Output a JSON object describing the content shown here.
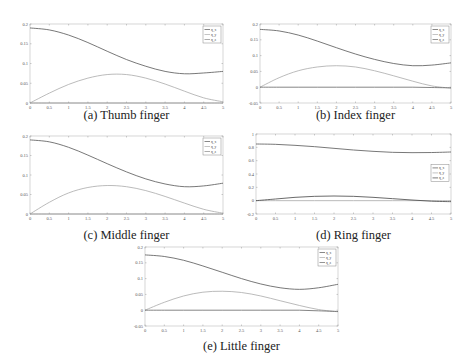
{
  "figure": {
    "panels": [
      {
        "id": "a",
        "caption": "(a) Thumb finger"
      },
      {
        "id": "b",
        "caption": "(b) Index finger"
      },
      {
        "id": "c",
        "caption": "(c) Middle finger"
      },
      {
        "id": "d",
        "caption": "(d) Ring finger"
      },
      {
        "id": "e",
        "caption": "(e) Little finger"
      }
    ]
  },
  "chart_data": [
    {
      "type": "line",
      "title": "(a) Thumb finger",
      "xlabel": "",
      "ylabel": "",
      "xlim": [
        0,
        5
      ],
      "ylim": [
        0,
        0.2
      ],
      "xticks": [
        "0",
        "0.5",
        "1",
        "1.5",
        "2",
        "2.5",
        "3",
        "3.5",
        "4",
        "4.5",
        "5"
      ],
      "yticks": [
        "0",
        "0.05",
        "0.1",
        "0.15",
        "0.2"
      ],
      "legend": [
        "q_x",
        "q_y",
        "q_z"
      ],
      "legend_position": "upper right",
      "grid": false,
      "x": [
        0,
        0.5,
        1,
        1.5,
        2,
        2.5,
        3,
        3.5,
        4,
        4.5,
        5
      ],
      "series": [
        {
          "name": "q_x",
          "color": "#555555",
          "values": [
            0.19,
            0.185,
            0.172,
            0.153,
            0.131,
            0.11,
            0.093,
            0.08,
            0.074,
            0.076,
            0.08
          ]
        },
        {
          "name": "q_y",
          "color": "#aaaaaa",
          "values": [
            0.0,
            0.025,
            0.047,
            0.063,
            0.072,
            0.072,
            0.063,
            0.048,
            0.03,
            0.013,
            0.003
          ]
        },
        {
          "name": "q_z",
          "color": "#888888",
          "values": [
            0,
            0,
            0,
            0,
            0,
            0,
            0,
            0,
            0,
            0,
            0
          ]
        }
      ]
    },
    {
      "type": "line",
      "title": "(b) Index finger",
      "xlabel": "",
      "ylabel": "",
      "xlim": [
        0,
        5
      ],
      "ylim": [
        -0.05,
        0.2
      ],
      "xticks": [
        "0",
        "0.5",
        "1",
        "1.5",
        "2",
        "2.5",
        "3",
        "3.5",
        "4",
        "4.5",
        "5"
      ],
      "yticks": [
        "-0.05",
        "0",
        "0.05",
        "0.1",
        "0.15",
        "0.2"
      ],
      "legend": [
        "q_x",
        "q_y",
        "q_z"
      ],
      "legend_position": "upper right",
      "grid": false,
      "x": [
        0,
        0.5,
        1,
        1.5,
        2,
        2.5,
        3,
        3.5,
        4,
        4.5,
        5
      ],
      "series": [
        {
          "name": "q_x",
          "color": "#555555",
          "values": [
            0.183,
            0.178,
            0.165,
            0.146,
            0.125,
            0.105,
            0.088,
            0.075,
            0.068,
            0.07,
            0.077
          ]
        },
        {
          "name": "q_y",
          "color": "#aaaaaa",
          "values": [
            0.0,
            0.03,
            0.052,
            0.064,
            0.068,
            0.064,
            0.052,
            0.036,
            0.019,
            0.004,
            -0.003
          ]
        },
        {
          "name": "q_z",
          "color": "#666666",
          "values": [
            0,
            0,
            0,
            0,
            0,
            0,
            0,
            0,
            0,
            -0.001,
            -0.002
          ]
        }
      ]
    },
    {
      "type": "line",
      "title": "(c) Middle finger",
      "xlabel": "",
      "ylabel": "",
      "xlim": [
        0,
        5
      ],
      "ylim": [
        0,
        0.2
      ],
      "xticks": [
        "0",
        "0.5",
        "1",
        "1.5",
        "2",
        "2.5",
        "3",
        "3.5",
        "4",
        "4.5",
        "5"
      ],
      "yticks": [
        "0",
        "0.05",
        "0.1",
        "0.15",
        "0.2"
      ],
      "legend": [
        "q_x",
        "q_y",
        "q_z"
      ],
      "legend_position": "upper right",
      "grid": false,
      "x": [
        0,
        0.5,
        1,
        1.5,
        2,
        2.5,
        3,
        3.5,
        4,
        4.5,
        5
      ],
      "series": [
        {
          "name": "q_x",
          "color": "#555555",
          "values": [
            0.19,
            0.185,
            0.171,
            0.151,
            0.129,
            0.108,
            0.09,
            0.077,
            0.07,
            0.072,
            0.079
          ]
        },
        {
          "name": "q_y",
          "color": "#aaaaaa",
          "values": [
            0.0,
            0.03,
            0.054,
            0.068,
            0.073,
            0.07,
            0.06,
            0.045,
            0.028,
            0.012,
            0.002
          ]
        },
        {
          "name": "q_z",
          "color": "#888888",
          "values": [
            0,
            0,
            0,
            0,
            0,
            0,
            0,
            0,
            0,
            0,
            0
          ]
        }
      ]
    },
    {
      "type": "line",
      "title": "(d) Ring finger",
      "xlabel": "",
      "ylabel": "",
      "xlim": [
        0,
        5
      ],
      "ylim": [
        -0.2,
        1
      ],
      "xticks": [
        "0",
        "0.5",
        "1",
        "1.5",
        "2",
        "2.5",
        "3",
        "3.5",
        "4",
        "4.5",
        "5"
      ],
      "yticks": [
        "-0.2",
        "0",
        "0.2",
        "0.4",
        "0.6",
        "0.8",
        "1"
      ],
      "legend": [
        "q_x",
        "q_y",
        "q_z"
      ],
      "legend_position": "center right",
      "grid": false,
      "x": [
        0,
        0.5,
        1,
        1.5,
        2,
        2.5,
        3,
        3.5,
        4,
        4.5,
        5
      ],
      "series": [
        {
          "name": "q_x",
          "color": "#555555",
          "values": [
            0.85,
            0.845,
            0.83,
            0.81,
            0.785,
            0.76,
            0.74,
            0.725,
            0.72,
            0.722,
            0.73
          ]
        },
        {
          "name": "q_y",
          "color": "#aaaaaa",
          "values": [
            0,
            0,
            0,
            0,
            0,
            0,
            0,
            0,
            0,
            0,
            0
          ]
        },
        {
          "name": "q_z",
          "color": "#444444",
          "values": [
            0.0,
            0.025,
            0.05,
            0.065,
            0.07,
            0.065,
            0.05,
            0.03,
            0.01,
            -0.008,
            -0.015
          ]
        }
      ]
    },
    {
      "type": "line",
      "title": "(e) Little finger",
      "xlabel": "",
      "ylabel": "",
      "xlim": [
        0,
        5
      ],
      "ylim": [
        -0.05,
        0.2
      ],
      "xticks": [
        "0",
        "0.5",
        "1",
        "1.5",
        "2",
        "2.5",
        "3",
        "3.5",
        "4",
        "4.5",
        "5"
      ],
      "yticks": [
        "-0.05",
        "0",
        "0.05",
        "0.1",
        "0.15",
        "0.2"
      ],
      "legend": [
        "q_x",
        "q_y",
        "q_z"
      ],
      "legend_position": "upper right",
      "grid": false,
      "x": [
        0,
        0.5,
        1,
        1.5,
        2,
        2.5,
        3,
        3.5,
        4,
        4.5,
        5
      ],
      "series": [
        {
          "name": "q_x",
          "color": "#555555",
          "values": [
            0.175,
            0.17,
            0.158,
            0.14,
            0.12,
            0.1,
            0.083,
            0.071,
            0.066,
            0.071,
            0.082
          ]
        },
        {
          "name": "q_y",
          "color": "#aaaaaa",
          "values": [
            0.0,
            0.025,
            0.045,
            0.057,
            0.06,
            0.056,
            0.045,
            0.03,
            0.015,
            0.002,
            -0.005
          ]
        },
        {
          "name": "q_z",
          "color": "#666666",
          "values": [
            0,
            0,
            0,
            0,
            0,
            0,
            0,
            0,
            0,
            -0.002,
            -0.004
          ]
        }
      ]
    }
  ]
}
